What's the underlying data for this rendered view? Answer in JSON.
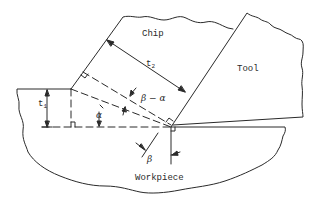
{
  "diagram": {
    "regions": {
      "chip": "Chip",
      "tool": "Tool",
      "workpiece": "Workpiece"
    },
    "dimensions": {
      "t1": {
        "symbol": "t",
        "subscript": "1"
      },
      "t2": {
        "symbol": "t",
        "subscript": "2"
      }
    },
    "angles": {
      "alpha": "α",
      "beta": "β",
      "beta_minus_alpha": "β − α"
    },
    "colors": {
      "line": "#2a2a2a",
      "background": "#ffffff"
    }
  }
}
